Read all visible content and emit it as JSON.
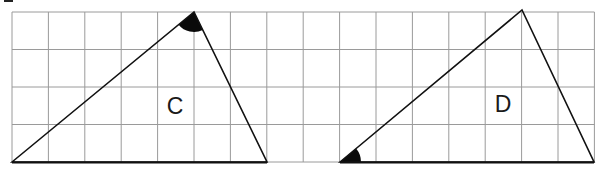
{
  "figure": {
    "grid": {
      "x0": 12,
      "y0": 12,
      "cols": 16,
      "rows": 4,
      "cell_w": 36.4,
      "cell_h": 37.5,
      "line_color": "#9a9a9a"
    },
    "shapes": [
      {
        "label": "C",
        "vertices_grid": [
          [
            0,
            4
          ],
          [
            5,
            0
          ],
          [
            7,
            4
          ]
        ],
        "marked_angle": "apex",
        "label_pos": [
          175,
          114
        ]
      },
      {
        "label": "D",
        "vertices_grid": [
          [
            9,
            4
          ],
          [
            14,
            0
          ],
          [
            16,
            4
          ]
        ],
        "marked_angle": "bottom-left",
        "label_pos": [
          503,
          112
        ]
      }
    ]
  }
}
